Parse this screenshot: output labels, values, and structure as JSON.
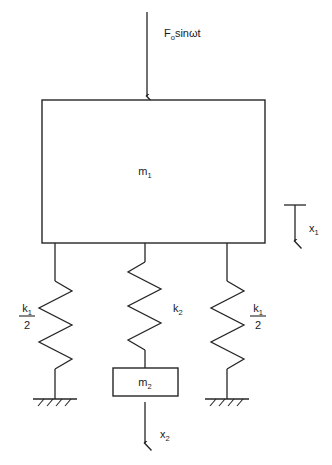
{
  "diagram": {
    "type": "mechanical-schematic",
    "stroke_color": "#262626",
    "background_color": "#ffffff",
    "labels": {
      "force": {
        "base": "F",
        "sub": "o",
        "rest": "sinωt",
        "full": "F₀sinωt"
      },
      "mass1": {
        "base": "m",
        "sub": "1",
        "full": "m₁"
      },
      "mass2": {
        "base": "m",
        "sub": "2",
        "full": "m₂"
      },
      "spring_left": {
        "numer_base": "k",
        "numer_sub": "1",
        "denom": "2",
        "full": "k₁/2"
      },
      "spring_center": {
        "base": "k",
        "sub": "2",
        "full": "k₂"
      },
      "spring_right": {
        "numer_base": "k",
        "numer_sub": "1",
        "denom": "2",
        "full": "k₁/2"
      },
      "disp1": {
        "base": "x",
        "sub": "1",
        "full": "x₁"
      },
      "disp2": {
        "base": "x",
        "sub": "2",
        "full": "x₂"
      }
    },
    "elements": {
      "force_arrow": {
        "name": "force-arrow",
        "x": 147,
        "y_top": 12,
        "y_bottom": 100
      },
      "mass1_block": {
        "name": "mass1-block",
        "x": 42,
        "y": 100,
        "width": 223,
        "height": 143
      },
      "mass2_block": {
        "name": "mass2-block",
        "x": 113,
        "y": 368,
        "width": 65,
        "height": 28
      },
      "spring_left": {
        "name": "spring-left",
        "x": 55,
        "y_top": 243,
        "y_bottom": 399,
        "coils": 5
      },
      "spring_center": {
        "name": "spring-center",
        "x": 145,
        "y_top": 243,
        "y_bottom": 368,
        "coils": 4
      },
      "spring_right": {
        "name": "spring-right",
        "x": 227,
        "y_top": 243,
        "y_bottom": 399,
        "coils": 5
      },
      "ground_left": {
        "name": "ground-left",
        "cx": 55,
        "y": 399,
        "half_width": 22
      },
      "ground_right": {
        "name": "ground-right",
        "cx": 227,
        "y": 399,
        "half_width": 22
      },
      "disp1_arrow": {
        "name": "displacement-arrow-x1",
        "x": 295,
        "y_top": 204,
        "y_bottom": 245
      },
      "disp2_arrow": {
        "name": "displacement-arrow-x2",
        "x": 145,
        "y_top": 402,
        "y_bottom": 447
      }
    }
  }
}
